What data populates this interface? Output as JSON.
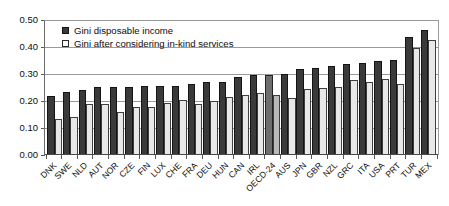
{
  "chart_data": {
    "type": "bar",
    "title": "",
    "xlabel": "",
    "ylabel": "",
    "ylim": [
      0.0,
      0.5
    ],
    "yticks": [
      "0.00",
      "0.10",
      "0.20",
      "0.30",
      "0.40",
      "0.50"
    ],
    "grid": true,
    "legend_position": "top-left",
    "categories": [
      "DNK",
      "SWE",
      "NLD",
      "AUT",
      "NOR",
      "CZE",
      "FIN",
      "LUX",
      "CHE",
      "FRA",
      "DEU",
      "HUN",
      "CAN",
      "IRL",
      "OECD-24",
      "AUS",
      "JPN",
      "GBR",
      "NZL",
      "GRC",
      "ITA",
      "USA",
      "PRT",
      "TUR",
      "MEX"
    ],
    "highlight_category": "OECD-24",
    "series": [
      {
        "name": "Gini disposable income",
        "color": "#3a3a3a",
        "values": [
          0.218,
          0.234,
          0.241,
          0.252,
          0.252,
          0.252,
          0.254,
          0.254,
          0.255,
          0.262,
          0.27,
          0.272,
          0.289,
          0.295,
          0.296,
          0.299,
          0.318,
          0.324,
          0.331,
          0.336,
          0.341,
          0.35,
          0.352,
          0.437,
          0.464
        ]
      },
      {
        "name": "Gini after considering in-kind services",
        "color": "#e8e8e8",
        "values": [
          0.133,
          0.142,
          0.19,
          0.189,
          0.16,
          0.178,
          0.179,
          0.191,
          0.204,
          0.189,
          0.201,
          0.216,
          0.224,
          0.228,
          0.222,
          0.212,
          0.246,
          0.248,
          0.251,
          0.279,
          0.272,
          0.282,
          0.262,
          0.398,
          0.425
        ]
      }
    ]
  },
  "axis": {
    "y_ticks": [
      "0.50",
      "0.40",
      "0.30",
      "0.20",
      "0.10",
      "0.00"
    ]
  },
  "legend": {
    "items": [
      {
        "label": "Gini disposable income",
        "swatch": "dark-square-icon"
      },
      {
        "label": "Gini after considering in-kind services",
        "swatch": "light-square-icon"
      }
    ]
  }
}
